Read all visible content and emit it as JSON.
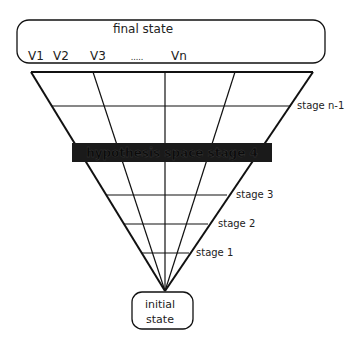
{
  "diagram": {
    "final_state": {
      "title": "final state",
      "variables": [
        "V1",
        "V2",
        "V3",
        ".....",
        "Vn"
      ]
    },
    "hypothesis_band": {
      "label": "hypothesis space stage 4"
    },
    "stage_labels": {
      "stage_n_minus_1": "stage n-1",
      "stage_3": "stage 3",
      "stage_2": "stage 2",
      "stage_1": "stage 1"
    },
    "initial_state": {
      "line1": "initial",
      "line2": "state"
    },
    "colors": {
      "line": "#111111",
      "band": "#1a1a1a",
      "band_text": "#0a0a0a",
      "background": "#ffffff"
    }
  }
}
